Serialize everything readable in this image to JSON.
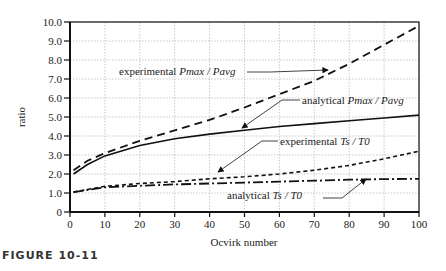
{
  "figure": {
    "caption": "FIGURE 10-11"
  },
  "chart_data": {
    "type": "line",
    "title": "",
    "xlabel": "Ocvirk number",
    "ylabel": "ratio",
    "xlim": [
      0,
      100
    ],
    "ylim": [
      0,
      10
    ],
    "grid": true,
    "x_ticks": [
      "0",
      "10",
      "20",
      "30",
      "40",
      "50",
      "60",
      "70",
      "80",
      "90",
      "100"
    ],
    "y_ticks": [
      "0",
      "1.0",
      "2.0",
      "3.0",
      "4.0",
      "5.0",
      "6.0",
      "7.0",
      "8.0",
      "9.0",
      "10.0"
    ],
    "series": [
      {
        "name": "experimental Pmax / Pavg",
        "style": "dashed",
        "x": [
          1,
          5,
          10,
          20,
          30,
          40,
          50,
          60,
          70,
          80,
          90,
          100
        ],
        "y": [
          2.2,
          2.7,
          3.1,
          3.75,
          4.3,
          4.85,
          5.5,
          6.2,
          6.9,
          7.8,
          8.8,
          9.8
        ]
      },
      {
        "name": "analytical Pmax / Pavg",
        "style": "solid",
        "x": [
          1,
          5,
          10,
          20,
          30,
          40,
          50,
          60,
          70,
          80,
          90,
          100
        ],
        "y": [
          2.0,
          2.5,
          2.95,
          3.5,
          3.85,
          4.1,
          4.3,
          4.5,
          4.65,
          4.8,
          4.95,
          5.1
        ]
      },
      {
        "name": "experimental Ts / T0",
        "style": "short-dashed",
        "x": [
          1,
          10,
          20,
          30,
          40,
          50,
          60,
          70,
          80,
          90,
          100
        ],
        "y": [
          1.05,
          1.35,
          1.5,
          1.6,
          1.75,
          1.85,
          2.0,
          2.2,
          2.45,
          2.8,
          3.2
        ]
      },
      {
        "name": "analytical Ts / T0",
        "style": "dash-dot",
        "x": [
          1,
          10,
          20,
          30,
          40,
          50,
          60,
          70,
          80,
          90,
          100
        ],
        "y": [
          1.05,
          1.3,
          1.38,
          1.45,
          1.5,
          1.55,
          1.6,
          1.65,
          1.7,
          1.73,
          1.75
        ]
      }
    ],
    "annotations": [
      {
        "label": "experimental",
        "sym": "Pmax / Pavg",
        "target_series": 0
      },
      {
        "label": "analytical",
        "sym": "Pmax / Pavg",
        "target_series": 1
      },
      {
        "label": "experimental",
        "sym": "Ts / T0",
        "target_series": 2
      },
      {
        "label": "analytical",
        "sym": "Ts / T0",
        "target_series": 3
      }
    ]
  }
}
